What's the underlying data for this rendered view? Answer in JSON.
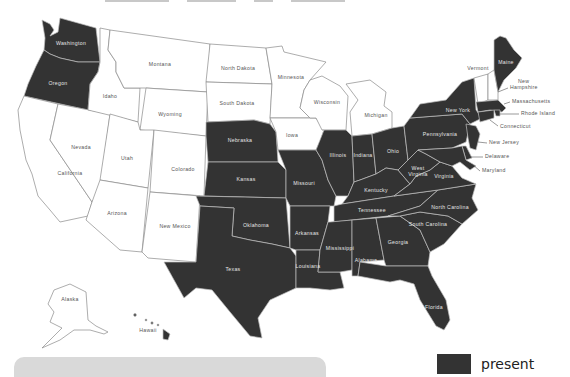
{
  "map": {
    "colors": {
      "present": "#333333",
      "absent": "#ffffff",
      "border_light": "#bfbfbf",
      "border_dark": "#8a8a8a"
    },
    "states": [
      {
        "name": "Washington",
        "status": "present"
      },
      {
        "name": "Oregon",
        "status": "present"
      },
      {
        "name": "California",
        "status": "absent"
      },
      {
        "name": "Nevada",
        "status": "absent"
      },
      {
        "name": "Idaho",
        "status": "absent"
      },
      {
        "name": "Montana",
        "status": "absent"
      },
      {
        "name": "Wyoming",
        "status": "absent"
      },
      {
        "name": "Utah",
        "status": "absent"
      },
      {
        "name": "Arizona",
        "status": "absent"
      },
      {
        "name": "Colorado",
        "status": "absent"
      },
      {
        "name": "New Mexico",
        "status": "absent"
      },
      {
        "name": "North Dakota",
        "status": "absent"
      },
      {
        "name": "South Dakota",
        "status": "absent"
      },
      {
        "name": "Nebraska",
        "status": "present"
      },
      {
        "name": "Kansas",
        "status": "present"
      },
      {
        "name": "Oklahoma",
        "status": "present"
      },
      {
        "name": "Texas",
        "status": "present"
      },
      {
        "name": "Minnesota",
        "status": "absent"
      },
      {
        "name": "Iowa",
        "status": "absent"
      },
      {
        "name": "Missouri",
        "status": "present"
      },
      {
        "name": "Arkansas",
        "status": "present"
      },
      {
        "name": "Louisiana",
        "status": "present"
      },
      {
        "name": "Wisconsin",
        "status": "absent"
      },
      {
        "name": "Illinois",
        "status": "present"
      },
      {
        "name": "Michigan",
        "status": "absent"
      },
      {
        "name": "Indiana",
        "status": "present"
      },
      {
        "name": "Ohio",
        "status": "present"
      },
      {
        "name": "Kentucky",
        "status": "present"
      },
      {
        "name": "Tennessee",
        "status": "present"
      },
      {
        "name": "Mississippi",
        "status": "present"
      },
      {
        "name": "Alabama",
        "status": "present"
      },
      {
        "name": "Georgia",
        "status": "present"
      },
      {
        "name": "Florida",
        "status": "present"
      },
      {
        "name": "South Carolina",
        "status": "present"
      },
      {
        "name": "North Carolina",
        "status": "present"
      },
      {
        "name": "Virginia",
        "status": "present"
      },
      {
        "name": "West Virginia",
        "status": "present"
      },
      {
        "name": "Pennsylvania",
        "status": "present"
      },
      {
        "name": "New York",
        "status": "present"
      },
      {
        "name": "Vermont",
        "status": "absent"
      },
      {
        "name": "New Hampshire",
        "status": "absent"
      },
      {
        "name": "Maine",
        "status": "present"
      },
      {
        "name": "Massachusetts",
        "status": "present"
      },
      {
        "name": "Rhode Island",
        "status": "present"
      },
      {
        "name": "Connecticut",
        "status": "present"
      },
      {
        "name": "New Jersey",
        "status": "present"
      },
      {
        "name": "Delaware",
        "status": "present"
      },
      {
        "name": "Maryland",
        "status": "present"
      },
      {
        "name": "Alaska",
        "status": "absent"
      },
      {
        "name": "Hawaii",
        "status": "present"
      }
    ],
    "labels": {
      "washington": "Washington",
      "oregon": "Oregon",
      "california": "California",
      "nevada": "Nevada",
      "idaho": "Idaho",
      "montana": "Montana",
      "wyoming": "Wyoming",
      "utah": "Utah",
      "arizona": "Arizona",
      "colorado": "Colorado",
      "new_mexico": "New Mexico",
      "north_dakota": "North Dakota",
      "south_dakota": "South Dakota",
      "nebraska": "Nebraska",
      "kansas": "Kansas",
      "oklahoma": "Oklahoma",
      "texas": "Texas",
      "minnesota": "Minnesota",
      "iowa": "Iowa",
      "missouri": "Missouri",
      "arkansas": "Arkansas",
      "louisiana": "Louisiana",
      "wisconsin": "Wisconsin",
      "illinois": "Illinois",
      "michigan": "Michigan",
      "indiana": "Indiana",
      "ohio": "Ohio",
      "kentucky": "Kentucky",
      "tennessee": "Tennessee",
      "mississippi": "Mississippi",
      "alabama": "Alabama",
      "georgia": "Georgia",
      "florida": "Florida",
      "south_carolina": "South Carolina",
      "north_carolina": "North Carolina",
      "virginia": "Virginia",
      "west_virginia_1": "West",
      "west_virginia_2": "Virginia",
      "pennsylvania": "Pennsylvania",
      "new_york": "New York",
      "vermont": "Vermont",
      "new_hampshire_1": "New",
      "new_hampshire_2": "Hampshire",
      "maine": "Maine",
      "massachusetts": "Massachusetts",
      "rhode_island": "Rhode Island",
      "connecticut": "Connecticut",
      "new_jersey": "New Jersey",
      "delaware": "Delaware",
      "maryland": "Maryland",
      "alaska": "Alaska",
      "hawaii": "Hawaii"
    }
  },
  "legend": {
    "items": [
      {
        "label": "present",
        "color": "#333333"
      }
    ]
  }
}
